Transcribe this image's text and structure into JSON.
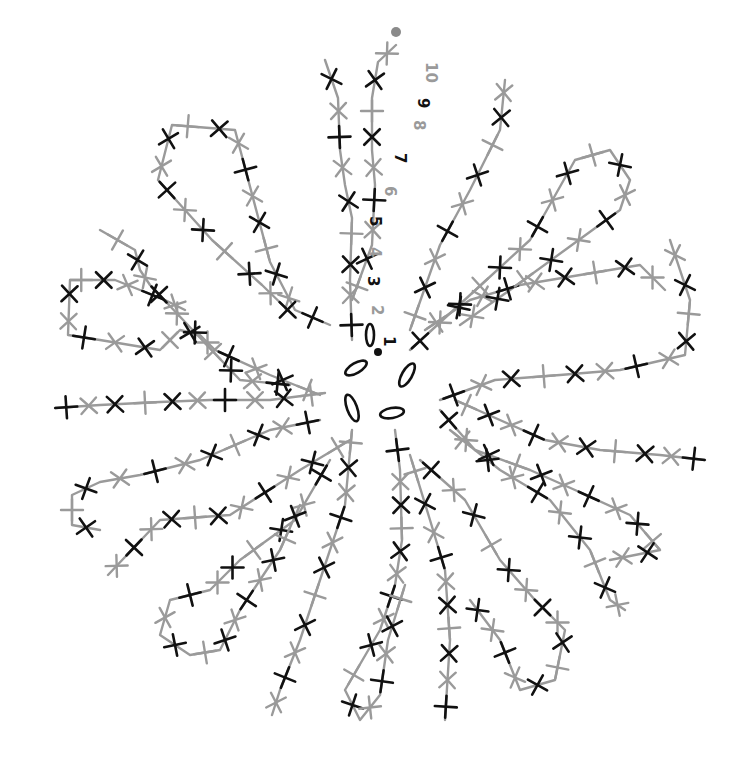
{
  "diagram": {
    "type": "crochet-chart",
    "colors": {
      "dark": "#111111",
      "light": "#9a9a9a",
      "background": "#ffffff"
    },
    "center": {
      "x": 378,
      "y": 390,
      "start_dot": true,
      "chains": 5
    },
    "end_dot": {
      "x": 396,
      "y": 32,
      "color": "#8a8a8a"
    },
    "row_labels": [
      {
        "text": "1",
        "x": 384,
        "y": 336,
        "color": "#111111",
        "rotate": 90
      },
      {
        "text": "2",
        "x": 372,
        "y": 305,
        "color": "#9a9a9a",
        "rotate": 90
      },
      {
        "text": "3",
        "x": 368,
        "y": 276,
        "color": "#111111",
        "rotate": 90
      },
      {
        "text": "4",
        "x": 370,
        "y": 247,
        "color": "#9a9a9a",
        "rotate": 90
      },
      {
        "text": "5",
        "x": 370,
        "y": 216,
        "color": "#111111",
        "rotate": 90
      },
      {
        "text": "6",
        "x": 385,
        "y": 186,
        "color": "#9a9a9a",
        "rotate": 90
      },
      {
        "text": "7",
        "x": 395,
        "y": 153,
        "color": "#111111",
        "rotate": 90
      },
      {
        "text": "8",
        "x": 414,
        "y": 120,
        "color": "#9a9a9a",
        "rotate": 90
      },
      {
        "text": "9",
        "x": 418,
        "y": 98,
        "color": "#111111",
        "rotate": 90
      },
      {
        "text": "10",
        "x": 426,
        "y": 62,
        "color": "#9a9a9a",
        "rotate": 90
      }
    ],
    "petal_count": 10,
    "stitch_symbol": "single-crochet (x / +)"
  }
}
